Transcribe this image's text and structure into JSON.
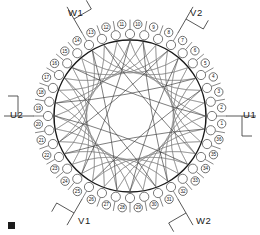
{
  "diagram": {
    "slot_count": 36,
    "phase_count": 3,
    "slot_numbers": [
      1,
      2,
      3,
      4,
      5,
      6,
      7,
      8,
      9,
      10,
      11,
      12,
      13,
      14,
      15,
      16,
      17,
      18,
      19,
      20,
      21,
      22,
      23,
      24,
      25,
      26,
      27,
      28,
      29,
      30,
      31,
      32,
      33,
      34,
      35,
      36
    ],
    "coil_span_slots": 8,
    "colors": {
      "background": "#ffffff",
      "outline": "#1a1a1a",
      "coil": "#7a7a7a",
      "coil_dark": "#3d3d3d",
      "slot_stroke": "#555555",
      "label_text": "#0d0d0d"
    },
    "terminals": [
      {
        "id": "u1",
        "label": "U1",
        "slot": 1,
        "x": 243,
        "y": 116,
        "anchor": "start"
      },
      {
        "id": "u2",
        "label": "U2",
        "slot": 19,
        "x": 10,
        "y": 116,
        "anchor": "start"
      },
      {
        "id": "v1",
        "label": "V1",
        "slot": 13,
        "x": 78,
        "y": 222,
        "anchor": "start"
      },
      {
        "id": "v2",
        "label": "V2",
        "slot": 31,
        "x": 190,
        "y": 14,
        "anchor": "start"
      },
      {
        "id": "w1",
        "label": "W1",
        "slot": 25,
        "x": 68,
        "y": 14,
        "anchor": "start"
      },
      {
        "id": "w2",
        "label": "W2",
        "slot": 7,
        "x": 196,
        "y": 222,
        "anchor": "start"
      }
    ],
    "corner_marker": {
      "present": true,
      "x": 8,
      "y": 222,
      "size": 7
    }
  }
}
